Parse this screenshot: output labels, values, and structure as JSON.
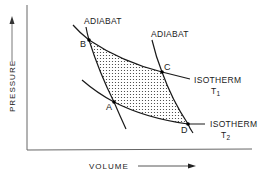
{
  "diagram": {
    "type": "pressure-volume (Carnot cycle)",
    "axes": {
      "x_label": "VOLUME",
      "y_label": "PRESSURE"
    },
    "curves": {
      "adiabat_left": {
        "label": "ADIABAT"
      },
      "adiabat_right": {
        "label": "ADIABAT"
      },
      "isotherm_upper": {
        "label": "ISOTHERM",
        "temp_symbol": "T",
        "temp_subscript": "1"
      },
      "isotherm_lower": {
        "label": "ISOTHERM",
        "temp_symbol": "T",
        "temp_subscript": "2"
      }
    },
    "points": {
      "A": "A",
      "B": "B",
      "C": "C",
      "D": "D"
    },
    "colors": {
      "line": "#1a1a1a",
      "background": "#ffffff",
      "shading_dots": "#333333"
    }
  }
}
